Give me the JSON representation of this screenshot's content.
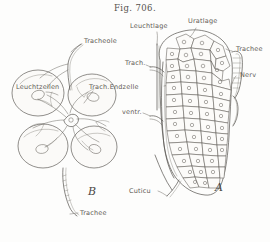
{
  "figure": {
    "caption": "Fig. 706.",
    "panels": [
      {
        "id": "A",
        "letter": "A"
      },
      {
        "id": "B",
        "letter": "B"
      }
    ],
    "labels": [
      {
        "key": "tracheole",
        "text": "Tracheole",
        "x": 84,
        "y": 41,
        "panel": "B"
      },
      {
        "key": "leuchtzellen",
        "text": "Leuchtzellen",
        "x": 16,
        "y": 87,
        "panel": "B"
      },
      {
        "key": "trach_endzelle",
        "text": "Trach.Endzelle",
        "x": 89,
        "y": 87,
        "panel": "B"
      },
      {
        "key": "trachee_bottom",
        "text": "Trachee",
        "x": 80,
        "y": 214,
        "panel": "B"
      },
      {
        "key": "leuchtlage",
        "text": "Leuchtlage",
        "x": 134,
        "y": 27,
        "panel": "A"
      },
      {
        "key": "uratlage",
        "text": "Uratlage",
        "x": 190,
        "y": 22,
        "panel": "A"
      },
      {
        "key": "trachee_right",
        "text": "Trachee",
        "x": 234,
        "y": 49,
        "panel": "A"
      },
      {
        "key": "nerv",
        "text": "Nerv",
        "x": 238,
        "y": 75,
        "panel": "A"
      },
      {
        "key": "trach_mid",
        "text": "Trach.",
        "x": 127,
        "y": 63,
        "panel": "A"
      },
      {
        "key": "ventr",
        "text": "ventr.",
        "x": 124,
        "y": 112,
        "panel": "A"
      },
      {
        "key": "cuticula",
        "text": "Cuticu",
        "x": 129,
        "y": 191,
        "panel": "A"
      }
    ],
    "panel_letter_positions": [
      {
        "key": "A",
        "x": 215,
        "y": 186
      },
      {
        "key": "B",
        "x": 88,
        "y": 190
      }
    ],
    "colors": {
      "ink": "#4a4744",
      "label_ink": "#5e5a55",
      "paper": "#fdfdfc",
      "cell_fill": "#fbfaf8"
    },
    "drawing_description": "Anatomical line drawing: panel B shows four large rounded light cells with tracheal end cell and branching tracheoles; panel A shows an elongated longitudinal section of a light organ with a mosaic of polygonal urate cells, a light layer, cuticle and tracheal/nerve branches."
  }
}
